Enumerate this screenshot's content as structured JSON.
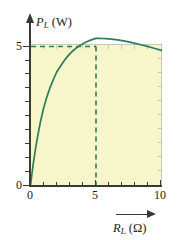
{
  "chart_data": {
    "type": "line",
    "title": "",
    "xlabel": "R_L (Ω)",
    "ylabel": "P_L (W)",
    "xlabel_symbol": "R",
    "xlabel_subscript": "L",
    "xlabel_unit": "(Ω)",
    "ylabel_symbol": "P",
    "ylabel_subscript": "L",
    "ylabel_unit": "(W)",
    "xlim": [
      0,
      10
    ],
    "ylim": [
      0,
      5.6
    ],
    "xticks": [
      0,
      1,
      2,
      3,
      4,
      5,
      6,
      7,
      8,
      9,
      10
    ],
    "xtick_labels": [
      "0",
      "",
      "",
      "",
      "",
      "5",
      "",
      "",
      "",
      "",
      "10"
    ],
    "yticks": [
      0,
      0.5,
      1,
      1.5,
      2,
      2.5,
      3,
      3.5,
      4,
      4.5,
      5
    ],
    "ytick_labels": [
      "0",
      "",
      "",
      "",
      "",
      "",
      "",
      "",
      "",
      "",
      "5"
    ],
    "grid": false,
    "legend": "none",
    "curve_color": "#2f7d5c",
    "plot_background": "#f7f6cb",
    "axis_color": "#3a3a33",
    "frame_color": "#c9c9bb",
    "equation": "P_L = 100 R_L / (5 + R_L)^2",
    "series": [
      {
        "name": "P_L",
        "x": [
          0,
          0.1,
          0.2,
          0.3,
          0.4,
          0.5,
          0.75,
          1,
          1.25,
          1.5,
          1.75,
          2,
          2.25,
          2.5,
          2.75,
          3,
          3.25,
          3.5,
          3.75,
          4,
          4.25,
          4.5,
          4.75,
          5,
          5.25,
          5.5,
          5.75,
          6,
          6.5,
          7,
          7.5,
          8,
          8.5,
          9,
          9.5,
          10
        ],
        "values": [
          0,
          0.385,
          0.74,
          1.068,
          1.371,
          1.653,
          2.276,
          2.778,
          3.189,
          3.531,
          3.818,
          4.082,
          4.26,
          4.444,
          4.6,
          4.734,
          4.848,
          4.947,
          5.031,
          5.102,
          5.162,
          5.213,
          5.255,
          5.291,
          5.29,
          5.287,
          5.281,
          5.272,
          5.247,
          5.21,
          5.165,
          5.112,
          5.054,
          4.993,
          4.929,
          4.863
        ]
      }
    ],
    "annotations": [
      {
        "name": "max-power-point",
        "x": 5,
        "y": 5,
        "label": "maximum power transfer",
        "guide_lines": [
          "horizontal-dashed-at-y-5",
          "vertical-dashed-at-x-5"
        ],
        "dash_color": "#2f7d5c"
      }
    ]
  },
  "labels": {
    "y_zero": "0",
    "y_five": "5",
    "x_zero": "0",
    "x_five": "5",
    "x_ten": "10"
  }
}
